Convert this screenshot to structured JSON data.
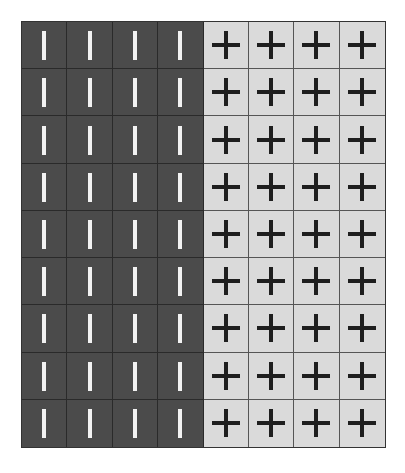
{
  "grid": {
    "rows": 9,
    "columns": 8,
    "colors": {
      "dark": "#4b4b4b",
      "light": "#dadada",
      "bar": "#f2f2f2",
      "plus": "#1e1e1e"
    },
    "row_pattern": [
      "bar",
      "bar",
      "bar",
      "bar",
      "plus",
      "plus",
      "plus",
      "plus"
    ]
  }
}
